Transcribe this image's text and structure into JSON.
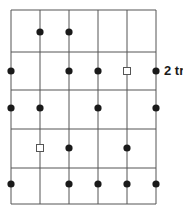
{
  "diagram": {
    "type": "grid-point-diagram",
    "colors": {
      "background": "#ffffff",
      "grid_line": "#555555",
      "dot": "#1a1a1a",
      "square_stroke": "#555555"
    },
    "grid": {
      "columns": 5,
      "rows": 5,
      "vertical_lines_x": [
        11,
        40,
        69,
        98,
        127,
        156
      ],
      "horizontal_lines_y": [
        10,
        52,
        90,
        129,
        168,
        204
      ]
    },
    "rows": [
      {
        "y": 32,
        "markers": [
          {
            "col": 1,
            "type": "dot"
          },
          {
            "col": 2,
            "type": "dot"
          }
        ]
      },
      {
        "y": 71,
        "markers": [
          {
            "col": 0,
            "type": "dot"
          },
          {
            "col": 2,
            "type": "dot"
          },
          {
            "col": 3,
            "type": "dot"
          },
          {
            "col": 4,
            "type": "square"
          },
          {
            "col": 5,
            "type": "dot"
          }
        ],
        "label": "2 tr"
      },
      {
        "y": 108,
        "markers": [
          {
            "col": 0,
            "type": "dot"
          },
          {
            "col": 1,
            "type": "dot"
          },
          {
            "col": 3,
            "type": "dot"
          },
          {
            "col": 5,
            "type": "dot"
          }
        ]
      },
      {
        "y": 148,
        "markers": [
          {
            "col": 1,
            "type": "square"
          },
          {
            "col": 2,
            "type": "dot"
          },
          {
            "col": 4,
            "type": "dot"
          }
        ]
      },
      {
        "y": 184,
        "markers": [
          {
            "col": 0,
            "type": "dot"
          },
          {
            "col": 2,
            "type": "dot"
          },
          {
            "col": 3,
            "type": "dot"
          },
          {
            "col": 4,
            "type": "dot"
          },
          {
            "col": 5,
            "type": "dot"
          }
        ]
      }
    ],
    "row_label": {
      "text": "2 tr",
      "row": 1
    }
  }
}
